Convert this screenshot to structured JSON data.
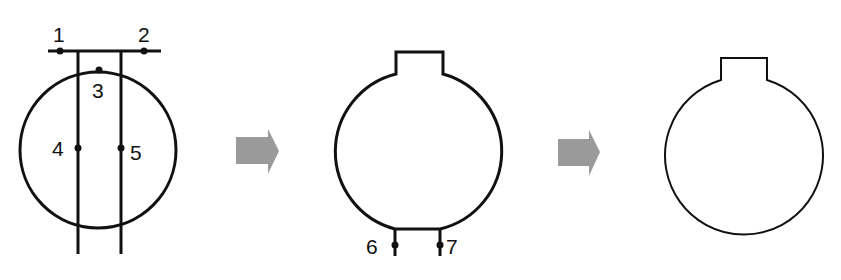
{
  "diagram": {
    "colors": {
      "stroke": "#111111",
      "arrow": "#9a9a9a",
      "background": "#ffffff"
    },
    "steps": [
      {
        "id": "step-1",
        "points": [
          {
            "label": "1",
            "x": 60,
            "y": 51
          },
          {
            "label": "2",
            "x": 144,
            "y": 51
          },
          {
            "label": "3",
            "x": 99,
            "y": 70
          },
          {
            "label": "4",
            "x": 78,
            "y": 148
          },
          {
            "label": "5",
            "x": 121,
            "y": 148
          }
        ]
      },
      {
        "id": "step-2",
        "points": [
          {
            "label": "6",
            "x": 395,
            "y": 245
          },
          {
            "label": "7",
            "x": 440,
            "y": 245
          }
        ]
      },
      {
        "id": "step-3",
        "points": []
      }
    ],
    "arrows": [
      {
        "id": "arrow-1",
        "direction": "right"
      },
      {
        "id": "arrow-2",
        "direction": "right"
      }
    ]
  }
}
